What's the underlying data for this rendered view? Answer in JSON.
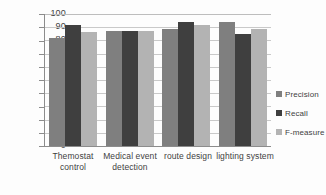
{
  "chart_data": {
    "type": "bar",
    "title": "",
    "xlabel": "",
    "ylabel": "",
    "ylim": [
      0,
      100
    ],
    "ytick_step": 10,
    "grid": true,
    "legend_position": "right",
    "categories": [
      "Themostat control",
      "Medical event detection",
      "route design",
      "lighting system"
    ],
    "category_lines": [
      [
        "Themostat",
        "control"
      ],
      [
        "Medical event",
        "detection"
      ],
      [
        "route design",
        ""
      ],
      [
        "lighting system",
        ""
      ]
    ],
    "series": [
      {
        "name": "Precision",
        "color": "#7f7f7f",
        "values": [
          81.5,
          87,
          89,
          94
        ]
      },
      {
        "name": "Recall",
        "color": "#3f3f3f",
        "values": [
          91.5,
          87,
          94,
          84.5
        ]
      },
      {
        "name": "F-measure",
        "color": "#b3b3b3",
        "values": [
          86,
          87,
          91.5,
          89
        ]
      }
    ],
    "ytick_labels": [
      "100",
      "90",
      "80",
      "70",
      "60",
      "50",
      "40",
      "30",
      "20",
      "10",
      "0"
    ]
  },
  "axis": {
    "y": {
      "t100": "100",
      "t90": "90",
      "t80": "80",
      "t70": "70",
      "t60": "60",
      "t50": "50",
      "t40": "40",
      "t30": "30",
      "t20": "20",
      "t10": "10",
      "t0": "0"
    },
    "x": {
      "cat1_line1": "Themostat",
      "cat1_line2": "control",
      "cat2_line1": "Medical event",
      "cat2_line2": "detection",
      "cat3_line1": "route design",
      "cat4_line1": "lighting system"
    }
  },
  "legend": {
    "precision": "Precision",
    "recall": "Recall",
    "fmeasure": "F-measure"
  }
}
